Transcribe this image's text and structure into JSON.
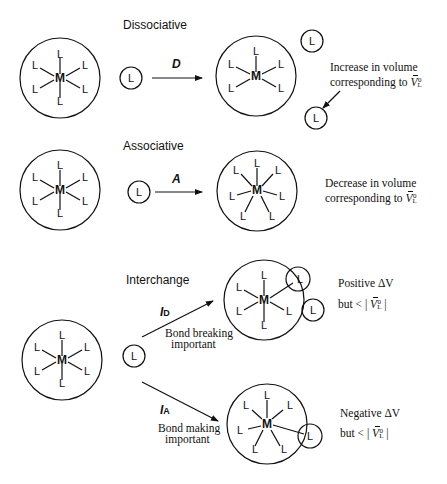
{
  "sections": {
    "dissociative": {
      "heading": "Dissociative",
      "arrow_label": "D",
      "note_line1": "Increase in volume",
      "note_line2": "corresponding to ",
      "note_symbol": "V",
      "note_sub": "L",
      "note_sup": "0"
    },
    "associative": {
      "heading": "Associative",
      "arrow_label": "A",
      "note_line1": "Decrease in volume",
      "note_line2": "corresponding to ",
      "note_symbol": "V",
      "note_sub": "L",
      "note_sup": "0"
    },
    "interchange": {
      "heading": "Interchange",
      "id": {
        "arrow_label": "I",
        "arrow_sub": "D",
        "caption_line1": "Bond breaking",
        "caption_line2": "important",
        "note_line1": "Positive ΔV",
        "note_line2_prefix": "but  < | ",
        "note_symbol": "V",
        "note_sub": "L",
        "note_sup": "0",
        "note_line2_suffix": " |"
      },
      "ia": {
        "arrow_label": "I",
        "arrow_sub": "A",
        "caption_line1": "Bond making",
        "caption_line2": "important",
        "note_line1": "Negative ΔV",
        "note_line2_prefix": "but  < | ",
        "note_symbol": "V",
        "note_sub": "L",
        "note_sup": "0",
        "note_line2_suffix": " |"
      }
    }
  },
  "symbols": {
    "metal": "M",
    "ligand": "L"
  },
  "colors": {
    "ink": "#111111",
    "background": "#ffffff"
  }
}
